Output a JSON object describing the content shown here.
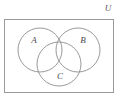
{
  "figure": {
    "type": "venn-diagram",
    "background_color": "#ffffff",
    "width": 121,
    "height": 106
  },
  "universe": {
    "label": "U",
    "rect": {
      "x": 4.5,
      "y": 19.5,
      "width": 109,
      "height": 73
    },
    "stroke_color": "#9a9a9a",
    "stroke_width": 1,
    "label_position": {
      "x": 108,
      "y": 9
    }
  },
  "sets": [
    {
      "key": "A",
      "label": "A",
      "cx": 40,
      "cy": 50,
      "r": 22,
      "stroke_color": "#8d8d8d",
      "label_position": {
        "x": 34,
        "y": 41
      }
    },
    {
      "key": "B",
      "label": "B",
      "cx": 78,
      "cy": 50,
      "r": 22,
      "stroke_color": "#8d8d8d",
      "label_position": {
        "x": 83,
        "y": 41
      }
    },
    {
      "key": "C",
      "label": "C",
      "cx": 59,
      "cy": 64,
      "r": 22,
      "stroke_color": "#8d8d8d",
      "label_position": {
        "x": 60,
        "y": 77
      }
    }
  ]
}
